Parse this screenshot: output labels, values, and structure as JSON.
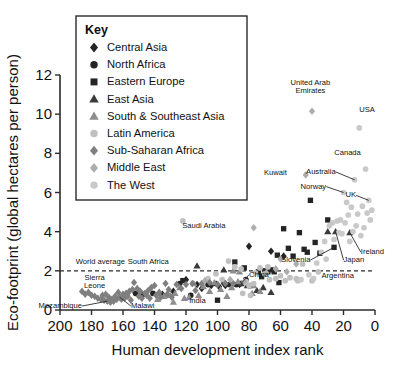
{
  "chart_data": {
    "type": "scatter",
    "title": "",
    "xlabel": "Human development index rank",
    "ylabel": "Eco-footprint (global hectares per person)",
    "xlim": [
      200,
      0
    ],
    "ylim": [
      0,
      12
    ],
    "x_ticks": [
      200,
      180,
      160,
      140,
      120,
      100,
      80,
      60,
      40,
      20,
      0
    ],
    "y_ticks": [
      0,
      2,
      4,
      6,
      8,
      10,
      12
    ],
    "x_axis_reversed": true,
    "grid": false,
    "legend_position": "upper-left-inset",
    "reference_lines": [
      {
        "name": "world-average",
        "axis": "y",
        "value": 2,
        "label": "World average",
        "style": "dashed"
      }
    ],
    "legend_title": "Key",
    "series": [
      {
        "name": "Central Asia",
        "marker": "diamond",
        "color": "#242424",
        "points": [
          [
            120,
            1.55
          ],
          [
            113,
            1.3
          ],
          [
            110,
            1.1
          ],
          [
            104,
            1.25
          ],
          [
            99,
            1.2
          ],
          [
            95,
            1.25
          ],
          [
            80,
            3.25
          ],
          [
            66,
            3.0
          ],
          [
            86,
            1.3
          ],
          [
            128,
            0.95
          ],
          [
            135,
            0.8
          ],
          [
            58,
            2.75
          ]
        ]
      },
      {
        "name": "North Africa",
        "marker": "circle",
        "color": "#242424",
        "points": [
          [
            152,
            0.85
          ],
          [
            147,
            0.8
          ],
          [
            141,
            0.85
          ],
          [
            124,
            1.35
          ],
          [
            117,
            0.75
          ],
          [
            106,
            1.3
          ],
          [
            101,
            1.35
          ],
          [
            96,
            1.4
          ],
          [
            88,
            1.3
          ],
          [
            82,
            1.55
          ]
        ]
      },
      {
        "name": "Eastern Europe",
        "marker": "square",
        "color": "#242424",
        "points": [
          [
            100,
            0.5
          ],
          [
            92,
            1.3
          ],
          [
            86,
            1.35
          ],
          [
            79,
            1.25
          ],
          [
            74,
            1.95
          ],
          [
            70,
            2.0
          ],
          [
            66,
            2.05
          ],
          [
            64,
            1.95
          ],
          [
            62,
            2.8
          ],
          [
            58,
            4.15
          ],
          [
            55,
            3.15
          ],
          [
            52,
            2.75
          ],
          [
            48,
            3.95
          ],
          [
            45,
            3.1
          ],
          [
            43,
            2.95
          ],
          [
            41,
            5.6
          ],
          [
            38,
            3.45
          ],
          [
            35,
            2.9
          ],
          [
            30,
            4.6
          ],
          [
            26,
            3.2
          ],
          [
            68,
            1.95
          ],
          [
            72,
            1.7
          ],
          [
            61,
            1.4
          ],
          [
            122,
            1.5
          ],
          [
            89,
            2.45
          ],
          [
            83,
            2.15
          ]
        ]
      },
      {
        "name": "East Asia",
        "marker": "triangle",
        "color": "#3a3a3a",
        "points": [
          [
            113,
            2.25
          ],
          [
            96,
            2.05
          ],
          [
            85,
            1.35
          ],
          [
            81,
            1.25
          ],
          [
            75,
            1.0
          ],
          [
            71,
            1.15
          ],
          [
            30,
            4.0
          ],
          [
            25,
            4.0
          ],
          [
            16,
            3.95
          ],
          [
            66,
            0.9
          ]
        ]
      },
      {
        "name": "South & Southeast Asia",
        "marker": "triangle",
        "color": "#8d8d8d",
        "points": [
          [
            138,
            0.55
          ],
          [
            134,
            0.7
          ],
          [
            130,
            0.75
          ],
          [
            127,
            0.85
          ],
          [
            124,
            1.15
          ],
          [
            121,
            0.6
          ],
          [
            118,
            0.65
          ],
          [
            115,
            1.35
          ],
          [
            112,
            0.75
          ],
          [
            109,
            1.2
          ],
          [
            105,
            0.95
          ],
          [
            102,
            1.4
          ],
          [
            98,
            1.05
          ],
          [
            94,
            0.7
          ],
          [
            91,
            1.15
          ],
          [
            87,
            1.45
          ],
          [
            78,
            0.85
          ],
          [
            73,
            0.95
          ],
          [
            86,
            1.95
          ],
          [
            128,
            0.4
          ],
          [
            90,
            2.0
          ],
          [
            77,
            1.25
          ]
        ]
      },
      {
        "name": "Latin America",
        "marker": "circle",
        "color": "#c0c0c0",
        "points": [
          [
            106,
            1.6
          ],
          [
            101,
            1.85
          ],
          [
            97,
            1.55
          ],
          [
            93,
            2.5
          ],
          [
            89,
            2.2
          ],
          [
            85,
            2.1
          ],
          [
            82,
            1.45
          ],
          [
            79,
            0.75
          ],
          [
            76,
            1.9
          ],
          [
            73,
            2.15
          ],
          [
            70,
            1.85
          ],
          [
            67,
            1.55
          ],
          [
            63,
            1.6
          ],
          [
            60,
            1.75
          ],
          [
            57,
            1.5
          ],
          [
            54,
            1.65
          ],
          [
            50,
            1.6
          ],
          [
            46,
            2.35
          ],
          [
            40,
            1.5
          ],
          [
            36,
            1.95
          ],
          [
            84,
            0.85
          ],
          [
            80,
            1.25
          ],
          [
            77,
            1.35
          ],
          [
            122,
            4.55
          ],
          [
            68,
            2.2
          ],
          [
            49,
            1.5
          ]
        ]
      },
      {
        "name": "Sub-Saharan Africa",
        "marker": "diamond",
        "color": "#7f7f7f",
        "points": [
          [
            186,
            0.95
          ],
          [
            184,
            0.8
          ],
          [
            182,
            0.9
          ],
          [
            180,
            0.75
          ],
          [
            178,
            0.7
          ],
          [
            176,
            0.6
          ],
          [
            174,
            0.55
          ],
          [
            172,
            0.5
          ],
          [
            170,
            0.45
          ],
          [
            168,
            0.4
          ],
          [
            166,
            0.45
          ],
          [
            164,
            0.55
          ],
          [
            162,
            0.65
          ],
          [
            160,
            0.8
          ],
          [
            158,
            0.85
          ],
          [
            156,
            0.95
          ],
          [
            154,
            1.05
          ],
          [
            153,
            1.4
          ],
          [
            151,
            1.1
          ],
          [
            149,
            0.95
          ],
          [
            146,
            0.85
          ],
          [
            144,
            1.0
          ],
          [
            142,
            1.15
          ],
          [
            140,
            1.25
          ],
          [
            137,
            0.9
          ],
          [
            133,
            1.35
          ],
          [
            131,
            1.05
          ],
          [
            126,
            1.3
          ],
          [
            120,
            1.3
          ],
          [
            116,
            1.35
          ],
          [
            110,
            1.35
          ],
          [
            105,
            1.4
          ],
          [
            100,
            1.3
          ],
          [
            95,
            1.35
          ],
          [
            90,
            1.35
          ],
          [
            173,
            0.75
          ],
          [
            171,
            0.8
          ],
          [
            169,
            0.65
          ],
          [
            167,
            0.55
          ],
          [
            165,
            0.7
          ],
          [
            163,
            0.9
          ],
          [
            161,
            0.55
          ],
          [
            159,
            0.6
          ],
          [
            157,
            0.7
          ],
          [
            155,
            0.5
          ],
          [
            150,
            0.7
          ],
          [
            148,
            0.6
          ],
          [
            145,
            0.75
          ],
          [
            143,
            0.6
          ],
          [
            139,
            0.75
          ],
          [
            136,
            0.65
          ],
          [
            132,
            0.8
          ],
          [
            129,
            0.65
          ],
          [
            123,
            1.1
          ],
          [
            114,
            1.0
          ]
        ]
      },
      {
        "name": "Middle East",
        "marker": "diamond",
        "color": "#adadad",
        "points": [
          [
            77,
            4.2
          ],
          [
            44,
            6.9
          ],
          [
            40,
            10.15
          ],
          [
            92,
            1.55
          ],
          [
            83,
            1.45
          ],
          [
            69,
            1.9
          ],
          [
            63,
            2.1
          ],
          [
            56,
            1.95
          ],
          [
            50,
            2.35
          ],
          [
            108,
            1.5
          ],
          [
            60,
            2.6
          ]
        ]
      },
      {
        "name": "The West",
        "marker": "circle",
        "color": "#c9c9c9",
        "points": [
          [
            10,
            9.3
          ],
          [
            6,
            7.2
          ],
          [
            13,
            6.65
          ],
          [
            20,
            6.0
          ],
          [
            4,
            5.6
          ],
          [
            8,
            5.3
          ],
          [
            15,
            5.25
          ],
          [
            11,
            4.9
          ],
          [
            17,
            4.85
          ],
          [
            22,
            4.6
          ],
          [
            24,
            4.55
          ],
          [
            19,
            4.45
          ],
          [
            12,
            4.3
          ],
          [
            7,
            4.2
          ],
          [
            14,
            4.0
          ],
          [
            9,
            3.8
          ],
          [
            21,
            3.9
          ],
          [
            27,
            4.45
          ],
          [
            29,
            4.3
          ],
          [
            32,
            3.5
          ],
          [
            3,
            4.6
          ],
          [
            5,
            4.95
          ],
          [
            18,
            5.5
          ],
          [
            2,
            5.1
          ],
          [
            23,
            3.95
          ],
          [
            16,
            3.5
          ],
          [
            26,
            3.6
          ],
          [
            34,
            2.95
          ],
          [
            31,
            2.6
          ],
          [
            37,
            2.4
          ],
          [
            42,
            1.8
          ],
          [
            39,
            1.6
          ],
          [
            47,
            1.55
          ]
        ]
      }
    ],
    "annotations": [
      {
        "text": "United Arab\nEmirates",
        "target_x": 40,
        "target_y": 10.15,
        "label_x": 41,
        "label_y": 11.5,
        "leader": false
      },
      {
        "text": "USA",
        "target_x": 10,
        "target_y": 9.3,
        "label_x": 10,
        "label_y": 10.1,
        "leader": false
      },
      {
        "text": "Kuwait",
        "target_x": 44,
        "target_y": 6.9,
        "label_x": 56,
        "label_y": 6.9,
        "leader": false
      },
      {
        "text": "Canada",
        "target_x": 6,
        "target_y": 7.2,
        "label_x": 9,
        "label_y": 7.9,
        "leader": false
      },
      {
        "text": "Australia",
        "target_x": 13,
        "target_y": 6.65,
        "label_x": 25,
        "label_y": 6.95,
        "leader": true
      },
      {
        "text": "Norway",
        "target_x": 20,
        "target_y": 6.0,
        "label_x": 31,
        "label_y": 6.2,
        "leader": true
      },
      {
        "text": "UK",
        "target_x": 4,
        "target_y": 5.6,
        "label_x": 12,
        "label_y": 5.75,
        "leader": true
      },
      {
        "text": "Saudi Arabia",
        "target_x": 77,
        "target_y": 4.2,
        "label_x": 95,
        "label_y": 4.2,
        "leader": false
      },
      {
        "text": "Ireland",
        "target_x": 16,
        "target_y": 3.95,
        "label_x": 9,
        "label_y": 2.85,
        "leader": true
      },
      {
        "text": "Japan",
        "target_x": 25,
        "target_y": 4.0,
        "label_x": 20,
        "label_y": 2.45,
        "leader": true
      },
      {
        "text": "Slovenia",
        "target_x": 26,
        "target_y": 3.2,
        "label_x": 41,
        "label_y": 2.45,
        "leader": true
      },
      {
        "text": "Argentina",
        "target_x": 36,
        "target_y": 1.95,
        "label_x": 34,
        "label_y": 1.65,
        "leader": false
      },
      {
        "text": "China",
        "target_x": 85,
        "target_y": 1.35,
        "label_x": 80,
        "label_y": 1.7,
        "leader": true
      },
      {
        "text": "South Africa",
        "target_x": 113,
        "target_y": 2.25,
        "label_x": 131,
        "label_y": 2.35,
        "leader": false
      },
      {
        "text": "India",
        "target_x": 124,
        "target_y": 0.55,
        "label_x": 118,
        "label_y": 0.35,
        "leader": false
      },
      {
        "text": "Sierra\nLeone",
        "target_x": 186,
        "target_y": 0.95,
        "label_x": 178,
        "label_y": 1.55,
        "leader": false
      },
      {
        "text": "Mozambique",
        "target_x": 170,
        "target_y": 0.45,
        "label_x": 186,
        "label_y": 0.1,
        "leader": true
      },
      {
        "text": "Malawi",
        "target_x": 162,
        "target_y": 0.65,
        "label_x": 155,
        "label_y": 0.1,
        "leader": true
      },
      {
        "text": "World average",
        "target_x": 200,
        "target_y": 2,
        "label_x": 190,
        "label_y": 2.35,
        "leader": false
      }
    ]
  },
  "legend": {
    "title": "Key",
    "items": [
      {
        "label": "Central Asia",
        "marker": "diamond",
        "color": "#242424"
      },
      {
        "label": "North Africa",
        "marker": "circle",
        "color": "#242424"
      },
      {
        "label": "Eastern Europe",
        "marker": "square",
        "color": "#242424"
      },
      {
        "label": "East Asia",
        "marker": "triangle",
        "color": "#3a3a3a"
      },
      {
        "label": "South & Southeast Asia",
        "marker": "triangle",
        "color": "#8d8d8d"
      },
      {
        "label": "Latin America",
        "marker": "circle",
        "color": "#c0c0c0"
      },
      {
        "label": "Sub-Saharan Africa",
        "marker": "diamond",
        "color": "#7f7f7f"
      },
      {
        "label": "Middle East",
        "marker": "diamond",
        "color": "#adadad"
      },
      {
        "label": "The West",
        "marker": "circle",
        "color": "#c9c9c9"
      }
    ]
  }
}
